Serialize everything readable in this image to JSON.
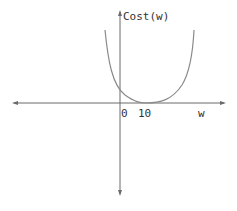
{
  "diagram": {
    "type": "function-plot",
    "y_axis_label": "Cost(w)",
    "x_axis_label": "w",
    "tick_labels": [
      "0",
      "10"
    ],
    "curve": "convex cost function with minimum near w=10, tangent to w-axis",
    "colors": {
      "axis": "#6b6b6b",
      "curve": "#8a8a8a",
      "text": "#333333"
    }
  }
}
